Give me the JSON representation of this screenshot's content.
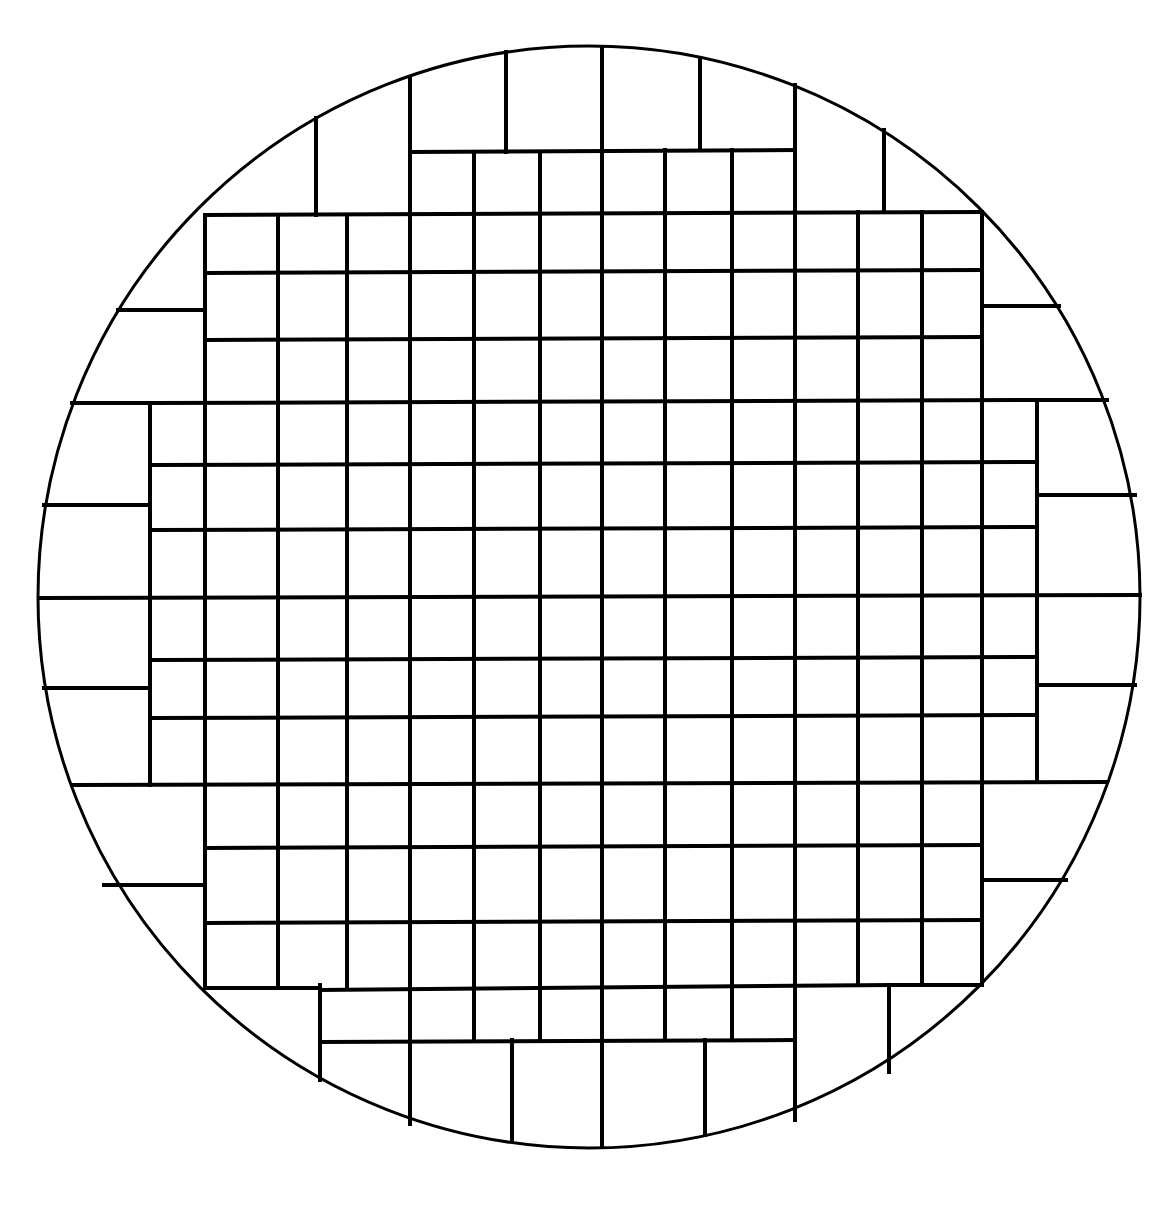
{
  "diagram": {
    "type": "wafer-die-map",
    "canvas": {
      "width": 1163,
      "height": 1211,
      "background": "#ffffff"
    },
    "line_color": "#000000",
    "circle": {
      "cx": 589,
      "cy": 597,
      "r": 551,
      "stroke_width": 3
    },
    "grid_stroke_width": 4,
    "segments": [
      {
        "x1": 205,
        "y1": 215,
        "x2": 982,
        "y2": 212
      },
      {
        "x1": 205,
        "y1": 273,
        "x2": 982,
        "y2": 270
      },
      {
        "x1": 205,
        "y1": 340,
        "x2": 982,
        "y2": 337
      },
      {
        "x1": 150,
        "y1": 403,
        "x2": 1037,
        "y2": 400
      },
      {
        "x1": 150,
        "y1": 465,
        "x2": 1037,
        "y2": 462
      },
      {
        "x1": 150,
        "y1": 530,
        "x2": 1037,
        "y2": 527
      },
      {
        "x1": 150,
        "y1": 660,
        "x2": 1037,
        "y2": 657
      },
      {
        "x1": 150,
        "y1": 718,
        "x2": 1037,
        "y2": 715
      },
      {
        "x1": 205,
        "y1": 848,
        "x2": 982,
        "y2": 845
      },
      {
        "x1": 205,
        "y1": 923,
        "x2": 982,
        "y2": 920
      },
      {
        "x1": 410,
        "y1": 152,
        "x2": 795,
        "y2": 150
      },
      {
        "x1": 320,
        "y1": 990,
        "x2": 889,
        "y2": 985
      },
      {
        "x1": 40,
        "y1": 598,
        "x2": 1140,
        "y2": 595
      },
      {
        "x1": 72,
        "y1": 785,
        "x2": 1107,
        "y2": 782
      },
      {
        "x1": 72,
        "y1": 403,
        "x2": 150,
        "y2": 403
      },
      {
        "x1": 1037,
        "y1": 400,
        "x2": 1107,
        "y2": 400
      },
      {
        "x1": 205,
        "y1": 988,
        "x2": 320,
        "y2": 988
      },
      {
        "x1": 889,
        "y1": 985,
        "x2": 982,
        "y2": 985
      },
      {
        "x1": 320,
        "y1": 1042,
        "x2": 795,
        "y2": 1040
      },
      {
        "x1": 118,
        "y1": 310,
        "x2": 205,
        "y2": 310
      },
      {
        "x1": 982,
        "y1": 306,
        "x2": 1059,
        "y2": 306
      },
      {
        "x1": 44,
        "y1": 505,
        "x2": 150,
        "y2": 505
      },
      {
        "x1": 1037,
        "y1": 495,
        "x2": 1135,
        "y2": 495
      },
      {
        "x1": 44,
        "y1": 688,
        "x2": 150,
        "y2": 688
      },
      {
        "x1": 1037,
        "y1": 685,
        "x2": 1135,
        "y2": 685
      },
      {
        "x1": 104,
        "y1": 885,
        "x2": 205,
        "y2": 885
      },
      {
        "x1": 982,
        "y1": 880,
        "x2": 1066,
        "y2": 880
      },
      {
        "x1": 205,
        "y1": 215,
        "x2": 205,
        "y2": 988
      },
      {
        "x1": 150,
        "y1": 403,
        "x2": 150,
        "y2": 785
      },
      {
        "x1": 1037,
        "y1": 400,
        "x2": 1037,
        "y2": 782
      },
      {
        "x1": 982,
        "y1": 212,
        "x2": 982,
        "y2": 985
      },
      {
        "x1": 278,
        "y1": 215,
        "x2": 278,
        "y2": 988
      },
      {
        "x1": 347,
        "y1": 215,
        "x2": 347,
        "y2": 988
      },
      {
        "x1": 410,
        "y1": 78,
        "x2": 410,
        "y2": 1124
      },
      {
        "x1": 474,
        "y1": 152,
        "x2": 474,
        "y2": 1040
      },
      {
        "x1": 540,
        "y1": 152,
        "x2": 540,
        "y2": 1040
      },
      {
        "x1": 602,
        "y1": 47,
        "x2": 602,
        "y2": 1147
      },
      {
        "x1": 665,
        "y1": 150,
        "x2": 665,
        "y2": 1040
      },
      {
        "x1": 732,
        "y1": 150,
        "x2": 732,
        "y2": 1040
      },
      {
        "x1": 795,
        "y1": 85,
        "x2": 795,
        "y2": 1120
      },
      {
        "x1": 858,
        "y1": 212,
        "x2": 858,
        "y2": 985
      },
      {
        "x1": 922,
        "y1": 212,
        "x2": 922,
        "y2": 985
      },
      {
        "x1": 316,
        "y1": 118,
        "x2": 316,
        "y2": 215
      },
      {
        "x1": 884,
        "y1": 130,
        "x2": 884,
        "y2": 212
      },
      {
        "x1": 506,
        "y1": 52,
        "x2": 506,
        "y2": 152
      },
      {
        "x1": 700,
        "y1": 58,
        "x2": 700,
        "y2": 150
      },
      {
        "x1": 320,
        "y1": 985,
        "x2": 320,
        "y2": 1080
      },
      {
        "x1": 889,
        "y1": 985,
        "x2": 889,
        "y2": 1072
      },
      {
        "x1": 512,
        "y1": 1040,
        "x2": 512,
        "y2": 1140
      },
      {
        "x1": 705,
        "y1": 1040,
        "x2": 705,
        "y2": 1135
      }
    ]
  }
}
